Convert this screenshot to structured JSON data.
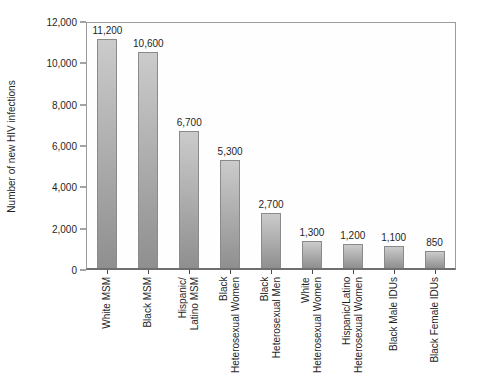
{
  "chart_data": {
    "type": "bar",
    "title": "",
    "xlabel": "",
    "ylabel": "Number of new HIV infections",
    "ylim": [
      0,
      12000
    ],
    "yticks": [
      0,
      2000,
      4000,
      6000,
      8000,
      10000,
      12000
    ],
    "yticks_display": [
      "0",
      "2,000",
      "4,000",
      "6,000",
      "8,000",
      "10,000",
      "12,000"
    ],
    "categories": [
      "White MSM",
      "Black MSM",
      "Hispanic/\nLatino MSM",
      "Black\nHeterosexual Women",
      "Black\nHeterosexual Men",
      "White\nHeterosexual Women",
      "Hispanic/Latino\nHeterosexual Women",
      "Black Male IDUs",
      "Black Female IDUs"
    ],
    "values": [
      11200,
      10600,
      6700,
      5300,
      2700,
      1300,
      1200,
      1100,
      850
    ],
    "values_display": [
      "11,200",
      "10,600",
      "6,700",
      "5,300",
      "2,700",
      "1,300",
      "1,200",
      "1,100",
      "850"
    ],
    "grid": false,
    "legend": "none",
    "colors": {
      "bar_top": "#cbcbcb",
      "bar_bottom": "#8f8f8f",
      "bar_border": "#8a8a8a",
      "axis_border": "#9c9c9c",
      "baseline": "#6f6f6f",
      "text": "#1f1f1f",
      "background": "#ffffff"
    }
  }
}
